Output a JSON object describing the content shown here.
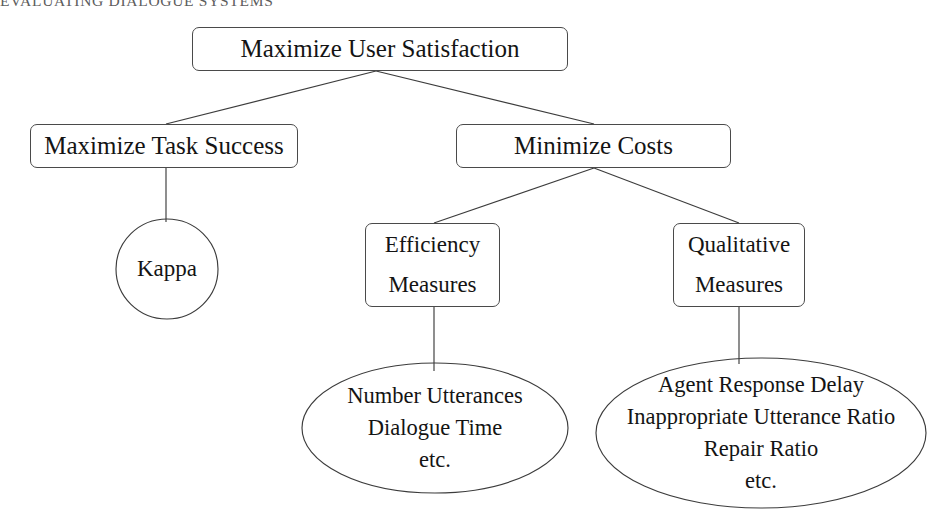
{
  "header": {
    "running_title": "EVALUATING DIALOGUE SYSTEMS"
  },
  "diagram": {
    "root": {
      "label": "Maximize User Satisfaction"
    },
    "task_success": {
      "label": "Maximize Task Success"
    },
    "minimize_costs": {
      "label": "Minimize Costs"
    },
    "efficiency": {
      "line1": "Efficiency",
      "line2": "Measures"
    },
    "qualitative": {
      "line1": "Qualitative",
      "line2": "Measures"
    },
    "kappa": {
      "label": "Kappa"
    },
    "efficiency_metrics": {
      "line1": "Number Utterances",
      "line2": "Dialogue Time",
      "line3": "etc."
    },
    "qualitative_metrics": {
      "line1": "Agent Response Delay",
      "line2": "Inappropriate Utterance Ratio",
      "line3": "Repair Ratio",
      "line4": "etc."
    }
  },
  "colors": {
    "stroke": "#3c3c3c",
    "text": "#141414",
    "header_text": "#5d5d5d",
    "background": "#ffffff"
  }
}
